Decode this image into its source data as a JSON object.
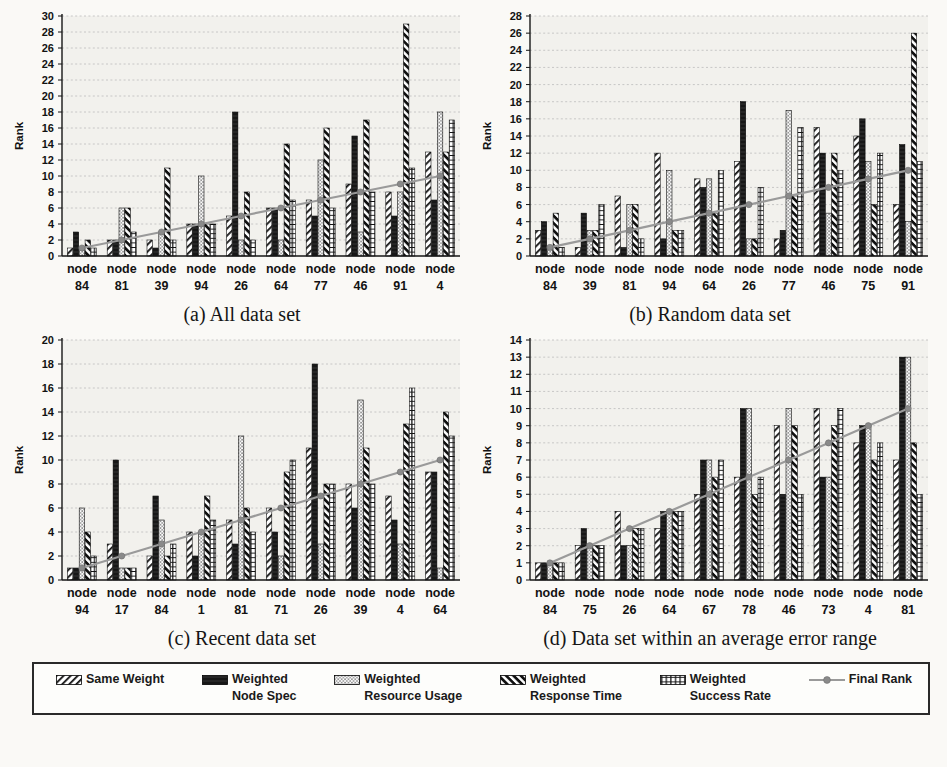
{
  "figure": {
    "background": "#faf9f6",
    "plot_background": "#f2f1ed",
    "grid_color": "#bdbdbd",
    "axis_color": "#161616",
    "line_color": "#9a9a9a",
    "marker_color": "#8a8a8a"
  },
  "legend": {
    "items": [
      {
        "line1": "Same Weight",
        "line2": "",
        "pattern": "diag-right"
      },
      {
        "line1": "Weighted",
        "line2": "Node Spec",
        "pattern": "solid"
      },
      {
        "line1": "Weighted",
        "line2": "Resource Usage",
        "pattern": "dots"
      },
      {
        "line1": "Weighted",
        "line2": "Response Time",
        "pattern": "diag-left"
      },
      {
        "line1": "Weighted",
        "line2": "Success Rate",
        "pattern": "plus"
      },
      {
        "line1": "Final Rank",
        "line2": "",
        "pattern": "line-marker"
      }
    ]
  },
  "chart_data": [
    {
      "id": "a",
      "type": "bar",
      "caption": "(a) All data set",
      "ylabel": "Rank",
      "node_prefix": "node",
      "nodes": [
        "84",
        "81",
        "39",
        "94",
        "26",
        "64",
        "77",
        "46",
        "91",
        "4"
      ],
      "ylim": [
        0,
        30
      ],
      "ytick_step": 2,
      "grid": true,
      "series": [
        {
          "name": "Same Weight",
          "pattern": "diag-right",
          "values": [
            1,
            2,
            2,
            4,
            5,
            6,
            7,
            9,
            8,
            13
          ]
        },
        {
          "name": "Weighted Node Spec",
          "pattern": "solid",
          "values": [
            3,
            2,
            1,
            4,
            18,
            6,
            5,
            15,
            5,
            7
          ]
        },
        {
          "name": "Weighted Resource Usage",
          "pattern": "dots",
          "values": [
            1,
            6,
            3,
            10,
            2,
            2,
            12,
            3,
            8,
            18
          ]
        },
        {
          "name": "Weighted Response Time",
          "pattern": "diag-left",
          "values": [
            2,
            6,
            11,
            4,
            8,
            14,
            16,
            17,
            29,
            13
          ]
        },
        {
          "name": "Weighted Success Rate",
          "pattern": "plus",
          "values": [
            1,
            3,
            2,
            4,
            2,
            7,
            6,
            8,
            11,
            17
          ]
        }
      ],
      "line_series": {
        "name": "Final Rank",
        "values": [
          1,
          2,
          3,
          4,
          5,
          6,
          7,
          8,
          9,
          10
        ]
      }
    },
    {
      "id": "b",
      "type": "bar",
      "caption": "(b) Random data set",
      "ylabel": "Rank",
      "node_prefix": "node",
      "nodes": [
        "84",
        "39",
        "81",
        "94",
        "64",
        "26",
        "77",
        "46",
        "75",
        "91"
      ],
      "ylim": [
        0,
        28
      ],
      "ytick_step": 2,
      "grid": true,
      "series": [
        {
          "name": "Same Weight",
          "pattern": "diag-right",
          "values": [
            3,
            1,
            7,
            12,
            9,
            11,
            2,
            15,
            14,
            6
          ]
        },
        {
          "name": "Weighted Node Spec",
          "pattern": "solid",
          "values": [
            4,
            5,
            1,
            2,
            8,
            18,
            3,
            12,
            16,
            13
          ]
        },
        {
          "name": "Weighted Resource Usage",
          "pattern": "dots",
          "values": [
            1,
            3,
            6,
            10,
            9,
            2,
            17,
            5,
            11,
            4
          ]
        },
        {
          "name": "Weighted Response Time",
          "pattern": "diag-left",
          "values": [
            5,
            3,
            6,
            3,
            5,
            2,
            7,
            12,
            6,
            26
          ]
        },
        {
          "name": "Weighted Success Rate",
          "pattern": "plus",
          "values": [
            1,
            6,
            2,
            3,
            10,
            8,
            15,
            10,
            12,
            11
          ]
        }
      ],
      "line_series": {
        "name": "Final Rank",
        "values": [
          1,
          2,
          3,
          4,
          5,
          6,
          7,
          8,
          9,
          10
        ]
      }
    },
    {
      "id": "c",
      "type": "bar",
      "caption": "(c) Recent data set",
      "ylabel": "Rank",
      "node_prefix": "node",
      "nodes": [
        "94",
        "17",
        "84",
        "1",
        "81",
        "71",
        "26",
        "39",
        "4",
        "64"
      ],
      "ylim": [
        0,
        20
      ],
      "ytick_step": 2,
      "grid": true,
      "series": [
        {
          "name": "Same Weight",
          "pattern": "diag-right",
          "values": [
            1,
            3,
            2,
            4,
            5,
            6,
            11,
            8,
            7,
            9
          ]
        },
        {
          "name": "Weighted Node Spec",
          "pattern": "solid",
          "values": [
            1,
            10,
            7,
            2,
            3,
            4,
            18,
            6,
            5,
            9
          ]
        },
        {
          "name": "Weighted Resource Usage",
          "pattern": "dots",
          "values": [
            6,
            1,
            5,
            4,
            12,
            2,
            3,
            15,
            3,
            1
          ]
        },
        {
          "name": "Weighted Response Time",
          "pattern": "diag-left",
          "values": [
            4,
            1,
            2,
            7,
            6,
            9,
            8,
            11,
            13,
            14
          ]
        },
        {
          "name": "Weighted Success Rate",
          "pattern": "plus",
          "values": [
            2,
            1,
            3,
            5,
            4,
            10,
            8,
            8,
            16,
            12
          ]
        }
      ],
      "line_series": {
        "name": "Final Rank",
        "values": [
          1,
          2,
          3,
          4,
          5,
          6,
          7,
          8,
          9,
          10
        ]
      }
    },
    {
      "id": "d",
      "type": "bar",
      "caption": "(d) Data set within an average error range",
      "ylabel": "Rank",
      "node_prefix": "node",
      "nodes": [
        "84",
        "75",
        "26",
        "64",
        "67",
        "78",
        "46",
        "73",
        "4",
        "81"
      ],
      "ylim": [
        0,
        14
      ],
      "ytick_step": 1,
      "grid": true,
      "series": [
        {
          "name": "Same Weight",
          "pattern": "diag-right",
          "values": [
            1,
            2,
            4,
            3,
            5,
            6,
            9,
            10,
            8,
            7
          ]
        },
        {
          "name": "Weighted Node Spec",
          "pattern": "solid",
          "values": [
            1,
            3,
            2,
            4,
            7,
            10,
            5,
            6,
            9,
            13
          ]
        },
        {
          "name": "Weighted Resource Usage",
          "pattern": "dots",
          "values": [
            1,
            2,
            2,
            4,
            7,
            10,
            10,
            6,
            9,
            13
          ]
        },
        {
          "name": "Weighted Response Time",
          "pattern": "diag-left",
          "values": [
            1,
            2,
            3,
            4,
            6,
            5,
            9,
            9,
            7,
            8
          ]
        },
        {
          "name": "Weighted Success Rate",
          "pattern": "plus",
          "values": [
            1,
            2,
            3,
            4,
            7,
            6,
            5,
            10,
            8,
            5
          ]
        }
      ],
      "line_series": {
        "name": "Final Rank",
        "values": [
          1,
          2,
          3,
          4,
          5,
          6,
          7,
          8,
          9,
          10
        ]
      }
    }
  ]
}
